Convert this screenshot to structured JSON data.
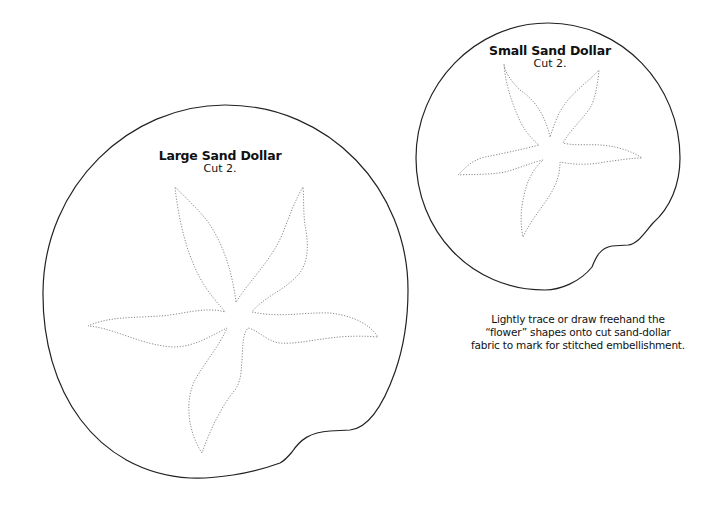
{
  "large": {
    "title": "Large Sand Dollar",
    "instruction": "Cut 2."
  },
  "small": {
    "title": "Small Sand Dollar",
    "instruction": "Cut 2."
  },
  "note": {
    "line1": "Lightly trace or draw freehand the",
    "line2": "“flower” shapes onto cut sand-dollar",
    "line3": "fabric to mark for stitched embellishment."
  },
  "colors": {
    "outline": "#222222",
    "stitch": "#8a8a8a",
    "background": "#ffffff"
  }
}
